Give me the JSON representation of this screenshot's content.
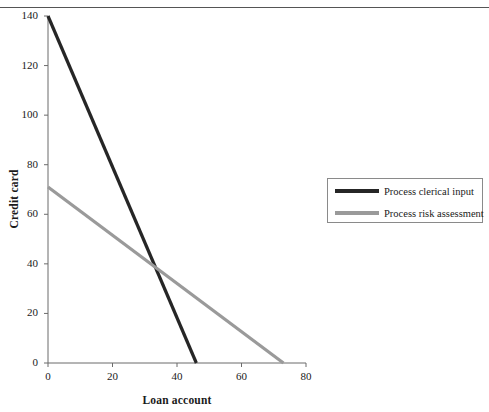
{
  "header": {
    "fragment_text": "",
    "rule_color": "#555555"
  },
  "chart_data": {
    "type": "line",
    "title": "",
    "xlabel": "Loan account",
    "ylabel": "Credit card",
    "xlim": [
      0,
      80
    ],
    "ylim": [
      0,
      140
    ],
    "xticks": [
      0,
      20,
      40,
      60,
      80
    ],
    "yticks": [
      0,
      20,
      40,
      60,
      80,
      100,
      120,
      140
    ],
    "xtick_labels": [
      "0",
      "20",
      "40",
      "60",
      "80"
    ],
    "ytick_labels": [
      "0",
      "20",
      "40",
      "60",
      "80",
      "100",
      "120",
      "140"
    ],
    "grid": false,
    "legend_position": "right-outside",
    "series": [
      {
        "name": "Process clerical input",
        "color": "#262626",
        "line_width": 3.2,
        "x": [
          0,
          46
        ],
        "y": [
          140,
          0
        ],
        "points": [
          [
            0,
            140
          ],
          [
            46,
            0
          ]
        ]
      },
      {
        "name": "Process risk assessment",
        "color": "#9a9a9a",
        "line_width": 3.2,
        "x": [
          0,
          73
        ],
        "y": [
          71,
          0
        ],
        "points": [
          [
            0,
            71
          ],
          [
            73,
            0
          ]
        ]
      }
    ],
    "annotations": [
      {
        "label": "intersection",
        "x": 33,
        "y": 40
      }
    ]
  },
  "legend": {
    "items": [
      {
        "label": "Process clerical input",
        "color": "#262626"
      },
      {
        "label": "Process risk assessment",
        "color": "#9a9a9a"
      }
    ]
  },
  "axis_style": {
    "axis_color": "#6b6b6b",
    "tick_color": "#6b6b6b"
  }
}
